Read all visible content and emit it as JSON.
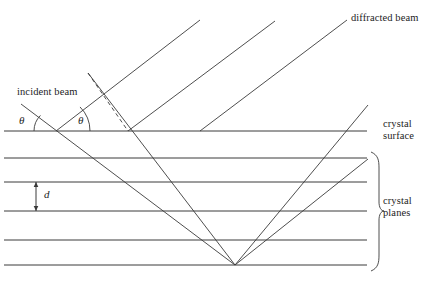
{
  "figure": {
    "kind": "bragg-diffraction-diagram",
    "title_visible": false,
    "background_color": "#ffffff",
    "line_color": "#3a3a3a",
    "text_color": "#1d1d1d"
  },
  "labels": {
    "incident_beam": "incident beam",
    "diffracted_beam": "diffracted beam",
    "crystal_surface_line1": "crystal",
    "crystal_surface_line2": "surface",
    "crystal_planes_line1": "crystal",
    "crystal_planes_line2": "planes",
    "theta_left": "θ",
    "theta_right": "θ",
    "spacing_d": "d"
  },
  "geometry": {
    "canvas": {
      "width": 441,
      "height": 282
    },
    "planes_x_start": 4,
    "planes_x_end": 367,
    "plane_y_values": [
      131,
      158,
      182,
      211,
      240,
      265
    ],
    "surface_plane_index": 0,
    "beam_angle_deg": 45,
    "incident_rays": [
      {
        "x1": 21,
        "y1": 104,
        "x2": 235,
        "y2": 265
      },
      {
        "x1": 88,
        "y1": 73,
        "x2": 235,
        "y2": 265
      }
    ],
    "diffracted_rays": [
      {
        "x1": 56,
        "y1": 131,
        "x2": 200,
        "y2": 20
      },
      {
        "x1": 128,
        "y1": 131,
        "x2": 275,
        "y2": 21
      },
      {
        "x1": 200,
        "y1": 131,
        "x2": 347,
        "y2": 20
      },
      {
        "x1": 235,
        "y1": 265,
        "x2": 368,
        "y2": 159
      },
      {
        "x1": 235,
        "y1": 265,
        "x2": 368,
        "y2": 105
      }
    ],
    "dashed_normal": {
      "x1": 88,
      "y1": 73,
      "x2": 128,
      "y2": 131
    },
    "angle_arcs": [
      {
        "cx": 56,
        "cy": 131,
        "r": 22,
        "side": "left"
      },
      {
        "cx": 56,
        "cy": 131,
        "r": 34,
        "side": "right"
      }
    ],
    "d_arrow": {
      "x": 36,
      "y_top": 182,
      "y_bottom": 211
    },
    "brace": {
      "x": 371,
      "y_top": 152,
      "y_bottom": 271,
      "tip_x": 379,
      "mid_y": 211
    }
  }
}
